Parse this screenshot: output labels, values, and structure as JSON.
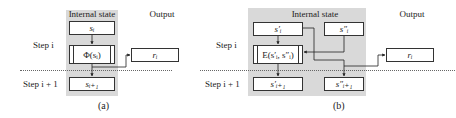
{
  "diagram_a": {
    "caption": "(a)",
    "header_internal": "Internal state",
    "header_output": "Output",
    "step_i": "Step i",
    "step_i1": "Step i + 1",
    "box_si": "sᵢ",
    "box_phi": "Φ(sᵢ)",
    "box_ri": "rᵢ",
    "box_si1": "sᵢ₊₁"
  },
  "diagram_b": {
    "caption": "(b)",
    "header_internal": "Internal state",
    "header_output": "Output",
    "step_i": "Step i",
    "step_i1": "Step i + 1",
    "box_s1i": "s′ᵢ",
    "box_s2i": "s″ᵢ",
    "box_E": "E(s′ᵢ, s″ᵢ)",
    "box_ri": "rᵢ",
    "box_s1i1": "s′ᵢ₊₁",
    "box_s2i1": "s″ᵢ₊₁"
  }
}
